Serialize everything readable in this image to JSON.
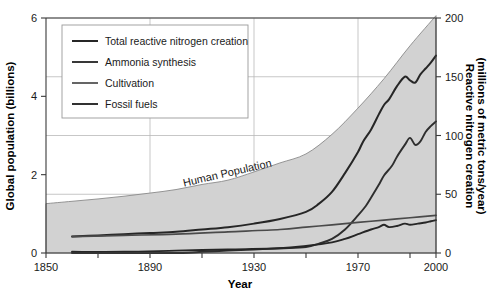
{
  "chart_data": {
    "type": "line",
    "title": "",
    "xlabel": "Year",
    "ylabel": "Global population (billions)",
    "y2label": "Reactive nitrogen creation (millions of metric tons/year)",
    "xlim": [
      1850,
      2000
    ],
    "ylim": [
      0,
      6
    ],
    "y2lim": [
      0,
      200
    ],
    "grid": true,
    "legend_position": "top-left",
    "xticks": [
      "1850",
      "1890",
      "1930",
      "1970",
      "2000"
    ],
    "xtick_values": [
      1850,
      1890,
      1930,
      1970,
      2000
    ],
    "xminor_values": [
      1870,
      1910,
      1950,
      1990
    ],
    "yticks": [
      "0",
      "2",
      "4",
      "6"
    ],
    "ytick_values": [
      0,
      2,
      4,
      6
    ],
    "y2ticks": [
      "0",
      "50",
      "100",
      "150",
      "200"
    ],
    "y2tick_values": [
      0,
      50,
      100,
      150,
      200
    ],
    "annotations": [
      {
        "text": "Human Population",
        "x": 1920,
        "y": 1.95,
        "rotation": -13
      }
    ],
    "area_series": {
      "name": "Human Population",
      "axis": "left",
      "units": "billions",
      "color": "#d2d2d2",
      "edge_color": "#8a8a8a",
      "x": [
        1850,
        1860,
        1870,
        1880,
        1890,
        1900,
        1910,
        1920,
        1930,
        1940,
        1950,
        1960,
        1970,
        1980,
        1990,
        2000
      ],
      "values": [
        1.26,
        1.32,
        1.38,
        1.45,
        1.53,
        1.62,
        1.75,
        1.86,
        2.07,
        2.3,
        2.53,
        3.03,
        3.7,
        4.45,
        5.29,
        6.06
      ]
    },
    "series": [
      {
        "name": "Total reactive nitrogen creation",
        "axis": "right",
        "units": "millions of metric tons/year",
        "color": "#262626",
        "width": 2.0,
        "x": [
          1860,
          1870,
          1880,
          1890,
          1900,
          1910,
          1920,
          1930,
          1940,
          1950,
          1955,
          1960,
          1965,
          1970,
          1972,
          1975,
          1978,
          1980,
          1982,
          1985,
          1988,
          1990,
          1992,
          1994,
          1996,
          1998,
          2000
        ],
        "values": [
          14,
          15,
          16,
          17,
          18,
          20,
          22,
          25,
          29,
          35,
          42,
          52,
          68,
          86,
          95,
          105,
          118,
          126,
          131,
          142,
          150,
          147,
          145,
          152,
          157,
          162,
          168
        ]
      },
      {
        "name": "Ammonia synthesis",
        "axis": "right",
        "units": "millions of metric tons/year",
        "color": "#2e2e2e",
        "width": 1.9,
        "x": [
          1860,
          1900,
          1910,
          1920,
          1930,
          1940,
          1950,
          1955,
          1960,
          1965,
          1970,
          1973,
          1975,
          1978,
          1980,
          1983,
          1985,
          1988,
          1990,
          1992,
          1994,
          1996,
          1998,
          2000
        ],
        "values": [
          0,
          0,
          1,
          2,
          3,
          4,
          5,
          8,
          12,
          20,
          32,
          40,
          47,
          58,
          66,
          74,
          82,
          92,
          98,
          92,
          95,
          103,
          108,
          112
        ]
      },
      {
        "name": "Cultivation",
        "axis": "right",
        "units": "millions of metric tons/year",
        "color": "#4a4a4a",
        "width": 1.7,
        "x": [
          1860,
          1880,
          1900,
          1920,
          1940,
          1950,
          1960,
          1970,
          1980,
          1990,
          2000
        ],
        "values": [
          14,
          15,
          16,
          18,
          20,
          22,
          24,
          26,
          28,
          30,
          32
        ]
      },
      {
        "name": "Fossil fuels",
        "axis": "right",
        "units": "millions of metric tons/year",
        "color": "#262626",
        "width": 1.9,
        "x": [
          1860,
          1880,
          1900,
          1920,
          1940,
          1950,
          1960,
          1965,
          1970,
          1975,
          1978,
          1980,
          1982,
          1985,
          1988,
          1990,
          1993,
          1996,
          1998,
          2000
        ],
        "values": [
          1,
          1,
          2,
          3,
          4,
          6,
          9,
          12,
          16,
          20,
          22,
          24,
          22,
          23,
          25,
          24,
          25,
          26,
          27,
          28
        ]
      }
    ]
  },
  "legend": {
    "items": [
      {
        "label": "Total reactive nitrogen creation",
        "color": "#262626",
        "width": 2.0
      },
      {
        "label": "Ammonia synthesis",
        "color": "#2e2e2e",
        "width": 1.9
      },
      {
        "label": "Cultivation",
        "color": "#4a4a4a",
        "width": 1.7
      },
      {
        "label": "Fossil fuels",
        "color": "#262626",
        "width": 1.9
      }
    ]
  }
}
